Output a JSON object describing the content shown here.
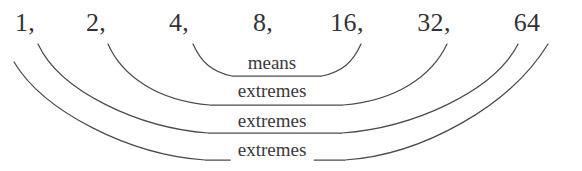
{
  "diagram": {
    "stroke_color": "#4b4a50",
    "text_color": "#333136",
    "background_color": "#ffffff",
    "sequence": [
      {
        "label": "1,",
        "value": 1,
        "x": 25
      },
      {
        "label": "2,",
        "value": 2,
        "x": 96
      },
      {
        "label": "4,",
        "value": 4,
        "x": 179
      },
      {
        "label": "8,",
        "value": 8,
        "x": 263
      },
      {
        "label": "16,",
        "value": 16,
        "x": 347
      },
      {
        "label": "32,",
        "value": 32,
        "x": 434
      },
      {
        "label": "64",
        "value": 64,
        "x": 527
      }
    ],
    "arcs": [
      {
        "label": "means",
        "connects": [
          8,
          16
        ],
        "left_x": 193,
        "right_x": 361,
        "top_y": 44,
        "bottom_y": 68,
        "path": "M 193 44 C 201 62, 212 72, 232 76 L 322 76 C 342 72, 353 62, 361 44"
      },
      {
        "label": "extremes",
        "connects": [
          4,
          32
        ],
        "left_x": 108,
        "right_x": 447,
        "top_y": 44,
        "bottom_y": 98,
        "path": "M 108 44 C 122 76, 158 101, 210 105 L 343 105 C 396 101, 432 76, 447 44"
      },
      {
        "label": "extremes",
        "connects": [
          2,
          64
        ],
        "left_x": 38,
        "right_x": 518,
        "top_y": 44,
        "bottom_y": 126,
        "path": "M 38 44 C 60 92, 140 128, 208 133 L 342 133 C 412 128, 494 92, 518 44"
      },
      {
        "label": "extremes",
        "connects": [
          1,
          64
        ],
        "left_x": 14,
        "right_x": 548,
        "top_y": 54,
        "bottom_y": 152,
        "path": "M 14 62 C 44 112, 130 155, 205 160 L 345 160 C 422 155, 510 106, 548 44"
      }
    ],
    "labels": {
      "means": "means",
      "extremes_1": "extremes",
      "extremes_2": "extremes",
      "extremes_3": "extremes"
    }
  }
}
